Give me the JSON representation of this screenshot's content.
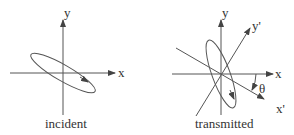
{
  "diagram": {
    "panels": [
      {
        "id": "incident",
        "caption": "incident",
        "axes": {
          "x_label": "x",
          "y_label": "y"
        },
        "ellipse": {
          "tilt_deg": 30,
          "description": "polarization ellipse tilted down-right with direction arrow"
        }
      },
      {
        "id": "transmitted",
        "caption": "transmitted",
        "axes": {
          "x_label": "x",
          "y_label": "y",
          "x_prime_label": "x'",
          "y_prime_label": "y'"
        },
        "angle_label": "θ",
        "ellipse": {
          "tilt_deg": -70,
          "description": "polarization ellipse tilted steeply with direction arrow"
        }
      }
    ],
    "colors": {
      "stroke": "#444444",
      "background": "#ffffff"
    }
  }
}
